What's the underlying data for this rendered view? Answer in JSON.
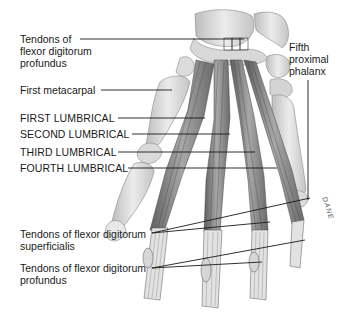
{
  "figure": {
    "signature": "DANE",
    "labels": {
      "fdp_top": [
        "Tendons of",
        "flexor digitorum",
        "profundus"
      ],
      "first_metacarpal": "First metacarpal",
      "fifth_proximal_phalanx": [
        "Fifth",
        "proximal",
        "phalanx"
      ],
      "first_lumbrical": "FIRST LUMBRICAL",
      "second_lumbrical": "SECOND LUMBRICAL",
      "third_lumbrical": "THIRD LUMBRICAL",
      "fourth_lumbrical": "FOURTH LUMBRICAL",
      "fds_bottom": [
        "Tendons of flexor digitorum",
        "superficialis"
      ],
      "fdp_bottom": [
        "Tendons of flexor digitorum",
        "profundus"
      ]
    },
    "colors": {
      "line": "#1a1a1a",
      "bone": "#e4e4e4",
      "bone_shade": "#b8b8b8",
      "muscle": "#8a8a8a",
      "muscle_dark": "#5a5a5a",
      "tendon": "#d0d0d0"
    }
  }
}
